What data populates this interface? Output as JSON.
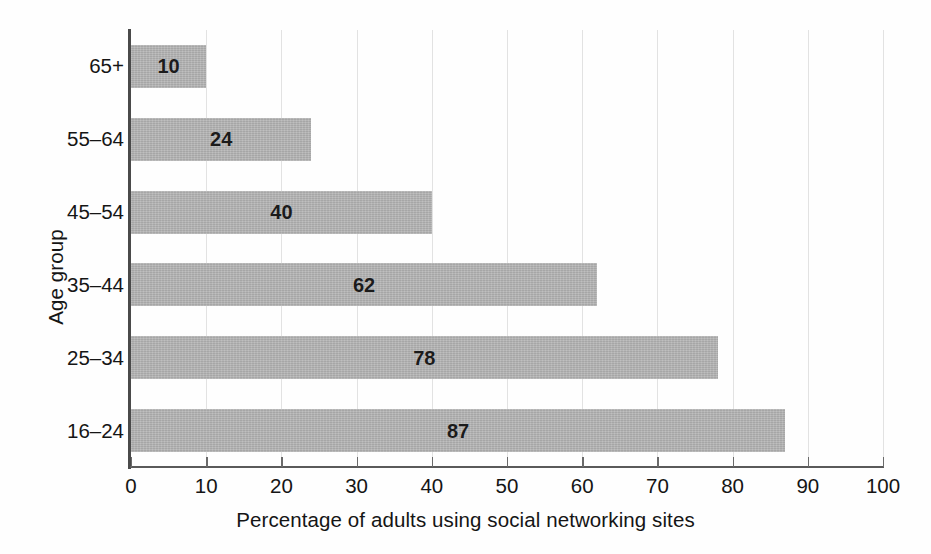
{
  "chart_data": {
    "type": "bar",
    "orientation": "horizontal",
    "title": "",
    "xlabel": "Percentage of adults using social networking sites",
    "ylabel": "Age group",
    "categories": [
      "65+",
      "55–64",
      "45–54",
      "35–44",
      "25–34",
      "16–24"
    ],
    "values": [
      10,
      24,
      40,
      62,
      78,
      87
    ],
    "data_labels": [
      "10",
      "24",
      "40",
      "62",
      "78",
      "87"
    ],
    "xlim": [
      0,
      100
    ],
    "xticks": [
      0,
      10,
      20,
      30,
      40,
      50,
      60,
      70,
      80,
      90,
      100
    ],
    "xtick_labels": [
      "0",
      "10",
      "20",
      "30",
      "40",
      "50",
      "60",
      "70",
      "80",
      "90",
      "100"
    ],
    "grid": "vertical",
    "legend": "none",
    "bar_color": "#b4b4b4",
    "label_color": "#1b1b1b",
    "gridline_color": "#e2e2e2",
    "axis_color": "#4a4a4a",
    "background": "#ffffff"
  }
}
